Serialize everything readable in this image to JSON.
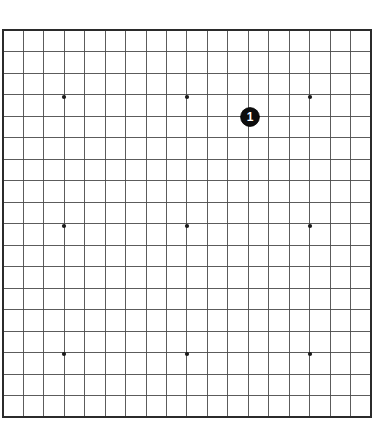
{
  "diagram": {
    "kind": "go-board-diagram",
    "board": {
      "size": 19,
      "columns": 19,
      "rows": 19,
      "geometry": {
        "left": 3,
        "top": 30,
        "right": 371,
        "bottom": 417,
        "cell_width": 20.44,
        "cell_height": 21.5,
        "outer_border_width": 1.6,
        "grid_line_width": 0.9
      },
      "colors": {
        "background": "#ffffff",
        "grid_line": "#4a4a4a",
        "border_line": "#2b2b2b",
        "star_point": "#1a1a1a",
        "stone_black_fill": "#0d0d0d",
        "stone_black_outline": "#000000",
        "stone_label_text": "#ffffff"
      }
    },
    "star_points": [
      {
        "name": "star-point-upper-left",
        "col": 3,
        "row": 3,
        "x": 64,
        "y": 97
      },
      {
        "name": "star-point-upper-middle",
        "col": 9,
        "row": 3,
        "x": 187,
        "y": 97
      },
      {
        "name": "star-point-upper-right",
        "col": 15,
        "row": 3,
        "x": 310,
        "y": 97
      },
      {
        "name": "star-point-middle-left",
        "col": 3,
        "row": 9,
        "x": 64,
        "y": 226
      },
      {
        "name": "star-point-center",
        "col": 9,
        "row": 9,
        "x": 187,
        "y": 226
      },
      {
        "name": "star-point-middle-right",
        "col": 15,
        "row": 9,
        "x": 310,
        "y": 226
      },
      {
        "name": "star-point-lower-left",
        "col": 3,
        "row": 15,
        "x": 64,
        "y": 354
      },
      {
        "name": "star-point-lower-middle",
        "col": 9,
        "row": 15,
        "x": 187,
        "y": 354
      },
      {
        "name": "star-point-lower-right",
        "col": 15,
        "row": 15,
        "x": 310,
        "y": 354
      }
    ],
    "star_point_radius": 2.1,
    "stones": [
      {
        "name": "stone-move-1",
        "color": "black",
        "label": "1",
        "move_number": 1,
        "col": 12,
        "row": 4,
        "x": 250,
        "y": 117,
        "radius": 9.4,
        "label_font_size": 12
      }
    ]
  }
}
